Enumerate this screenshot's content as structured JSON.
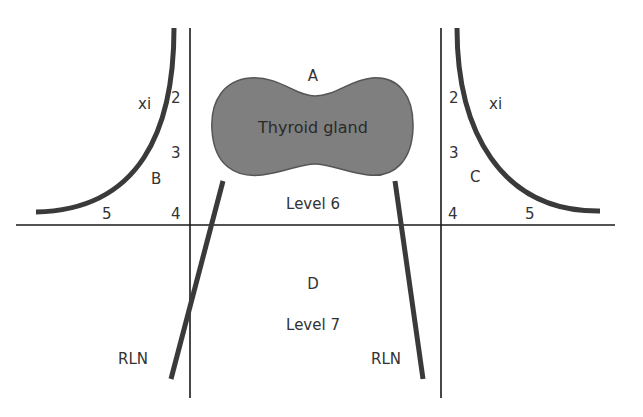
{
  "diagram": {
    "colors": {
      "background": "#ffffff",
      "line": "#1a1a1a",
      "nerve": "#3a3a3a",
      "gland_fill": "#7f7f7f",
      "gland_stroke": "#555555",
      "text": "#333333"
    },
    "labels": {
      "compartment_a": "A",
      "compartment_b": "B",
      "compartment_c": "C",
      "compartment_d": "D",
      "thyroid": "Thyroid gland",
      "level_6": "Level 6",
      "level_7": "Level 7",
      "xi_left": "xi",
      "xi_right": "xi",
      "rln_left": "RLN",
      "rln_right": "RLN",
      "left_levels": [
        "2",
        "3",
        "4",
        "5"
      ],
      "right_levels": [
        "2",
        "3",
        "4",
        "5"
      ]
    }
  }
}
